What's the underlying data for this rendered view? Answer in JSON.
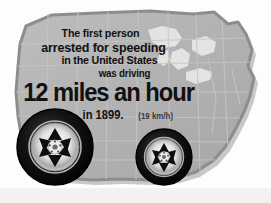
{
  "graphic": {
    "type": "trivia-infographic",
    "subject": "usa-map-with-wheels",
    "background_color": "#ffffff",
    "map": {
      "name": "united-states-map",
      "fill_color": "#b0b0b0",
      "outline_color": "#8f8f8f",
      "shadow_color": "#9a9a9a",
      "state_border_color": "#c9c9c9",
      "lakes_color": "#e8e8e8"
    },
    "wheels": [
      {
        "name": "front-wheel",
        "tire_color": "#111111",
        "rim_color": "#f0f0f0",
        "spokes": 6,
        "cx": 55,
        "cy": 147,
        "r": 38
      },
      {
        "name": "rear-wheel",
        "tire_color": "#111111",
        "rim_color": "#f0f0f0",
        "spokes": 6,
        "cx": 164,
        "cy": 157,
        "r": 28
      }
    ],
    "text_color": "#111111",
    "metric_color": "#3a3a3a",
    "footer_color": "#f2f2f2"
  },
  "caption": {
    "line1": "The first person",
    "line2": "arrested for speeding",
    "line3": "in the United States",
    "line4": "was driving",
    "headline": "12 miles an hour",
    "year": "in 1899.",
    "metric": "(19 km/h)"
  }
}
